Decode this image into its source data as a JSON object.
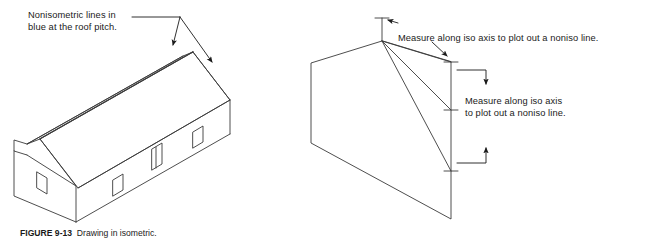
{
  "figure": {
    "caption_number": "FIGURE 9-13",
    "caption_text": "Drawing in isometric.",
    "labels": {
      "nonisometric_note": "Nonisometric lines in\nblue at the roof pitch.",
      "measure_note_top": "Measure along iso axis to plot out a noniso line.",
      "measure_note_right": "Measure along iso axis\nto plot out a noniso line."
    },
    "colors": {
      "line": "#3a3a3a",
      "text": "#1a1a1a",
      "background": "#ffffff",
      "arrow": "#1a1a1a"
    },
    "drawings": [
      {
        "name": "isometric-house",
        "type": "isometric-gabled-house",
        "parts": [
          "roof-front-plane",
          "roof-back-plane",
          "ridge-line",
          "left-gable-end",
          "right-gable-end",
          "front-wall",
          "eave-overhang",
          "door",
          "windows"
        ],
        "openings": [
          {
            "name": "window-gable-left",
            "kind": "window"
          },
          {
            "name": "window-front-left",
            "kind": "window"
          },
          {
            "name": "door-front",
            "kind": "door"
          },
          {
            "name": "window-front-right",
            "kind": "window"
          }
        ]
      },
      {
        "name": "construction-wedge",
        "type": "isometric-wedge-construction",
        "parts": [
          "wedge-outline",
          "apex-point",
          "construction-lines",
          "vertical-dimension-line-top",
          "vertical-dimension-line-right"
        ]
      }
    ],
    "annotations": [
      {
        "name": "leader-noniso-left",
        "kind": "arrow-leader"
      },
      {
        "name": "leader-noniso-right",
        "kind": "arrow-leader"
      },
      {
        "name": "leader-measure-top",
        "kind": "arrow-leader"
      },
      {
        "name": "leader-measure-right-upper",
        "kind": "arrow-leader"
      },
      {
        "name": "leader-measure-right-lower",
        "kind": "arrow-leader"
      }
    ]
  }
}
